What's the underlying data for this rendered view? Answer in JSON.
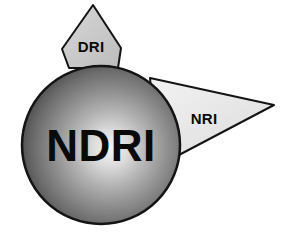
{
  "figure": {
    "type": "logo-diagram",
    "title_text": "NDRI",
    "background_color": "#ffffff",
    "outline_color": "#141414"
  },
  "sphere": {
    "label": "NDRI",
    "center_x": 101,
    "center_y": 145,
    "radius": 79,
    "highlight_color": "#f2f2f2",
    "mid_color": "#8c8c8c",
    "edge_color": "#3a3a3a",
    "outline_color": "#141414"
  },
  "cones": [
    {
      "name": "dri-cone",
      "label": "DRI",
      "label_x": 91,
      "label_y": 52,
      "fill_color": "#c9c9c9",
      "fill_color_light": "#d6d6d6",
      "outline_color": "#141414",
      "points": "93,5 121,48 118,68 69,68 62,49"
    },
    {
      "name": "nri-cone",
      "label": "NRI",
      "label_x": 204,
      "label_y": 124,
      "fill_color": "#e6e6e6",
      "fill_color_light": "#efefef",
      "outline_color": "#141414",
      "points": "150,78 274,105 158,166"
    }
  ]
}
